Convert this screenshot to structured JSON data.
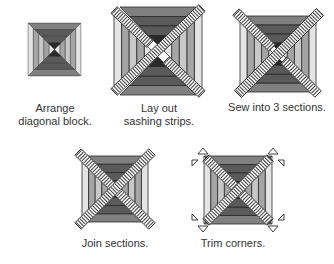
{
  "diagram": {
    "colors": {
      "outline": "#2a2a2a",
      "shade_1": "#5a5a5a",
      "shade_2": "#808080",
      "shade_3": "#a5a5a5",
      "shade_4": "#c8c8c8",
      "shade_5": "#e4e4e4",
      "sashing_fill": "#ffffff",
      "sashing_stripe": "#4a4a4a",
      "background": "#ffffff"
    },
    "steps": [
      {
        "id": 1,
        "caption": "Arrange\ndiagonal block."
      },
      {
        "id": 2,
        "caption": "Lay out\nsashing strips."
      },
      {
        "id": 3,
        "caption": "Sew into 3 sections."
      },
      {
        "id": 4,
        "caption": "Join sections."
      },
      {
        "id": 5,
        "caption": "Trim corners."
      }
    ]
  }
}
